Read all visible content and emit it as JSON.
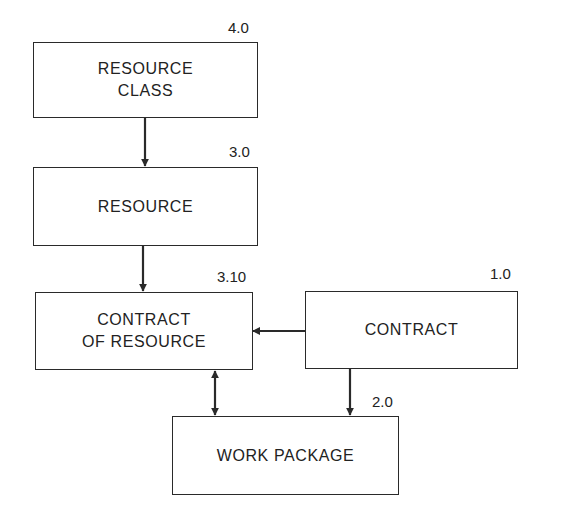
{
  "diagram": {
    "entities": [
      {
        "id": "resource-class",
        "label": "RESOURCE\nCLASS",
        "number": "4.0"
      },
      {
        "id": "resource",
        "label": "RESOURCE",
        "number": "3.0"
      },
      {
        "id": "contract-of-resource",
        "label": "CONTRACT\nOF RESOURCE",
        "number": "3.10"
      },
      {
        "id": "contract",
        "label": "CONTRACT",
        "number": "1.0"
      },
      {
        "id": "work-package",
        "label": "WORK PACKAGE",
        "number": "2.0"
      }
    ],
    "relationships": [
      {
        "from": "resource-class",
        "to": "resource",
        "type": "one-way"
      },
      {
        "from": "resource",
        "to": "contract-of-resource",
        "type": "one-way"
      },
      {
        "from": "contract",
        "to": "contract-of-resource",
        "type": "one-way"
      },
      {
        "from": "contract",
        "to": "work-package",
        "type": "one-way"
      },
      {
        "from": "contract-of-resource",
        "to": "work-package",
        "type": "two-way"
      }
    ],
    "colors": {
      "line": "#2a2a2a",
      "background": "#ffffff"
    }
  }
}
